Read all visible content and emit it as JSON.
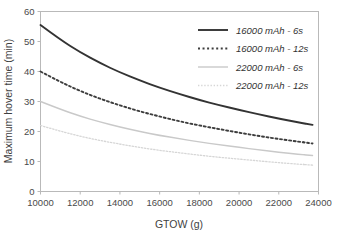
{
  "chart_data": {
    "type": "line",
    "title": "",
    "xlabel": "GTOW (g)",
    "ylabel": "Maximum hover time (min)",
    "xlim": [
      10000,
      24000
    ],
    "ylim": [
      0,
      60
    ],
    "xticks": [
      "10000",
      "12000",
      "14000",
      "16000",
      "18000",
      "20000",
      "22000",
      "24000"
    ],
    "yticks": [
      "0",
      "10",
      "20",
      "30",
      "40",
      "50",
      "60"
    ],
    "grid": false,
    "legend_position": "top-right",
    "x": [
      10000,
      11000,
      12000,
      13000,
      14000,
      15000,
      16000,
      17000,
      18000,
      19000,
      20000,
      21000,
      22000,
      23000,
      23700
    ],
    "series": [
      {
        "name": "16000 mAh - 6s",
        "style": "solid",
        "color": "#333333",
        "width": 1.9,
        "values": [
          55.5,
          50.6,
          46.4,
          42.8,
          39.7,
          37.0,
          34.6,
          32.5,
          30.5,
          28.8,
          27.2,
          25.7,
          24.3,
          23.0,
          22.2
        ]
      },
      {
        "name": "16000 mAh - 12s",
        "style": "dotted",
        "color": "#3d3d3d",
        "width": 1.9,
        "values": [
          40.0,
          36.5,
          33.5,
          30.9,
          28.7,
          26.7,
          25.0,
          23.4,
          22.0,
          20.8,
          19.6,
          18.5,
          17.5,
          16.6,
          16.0
        ]
      },
      {
        "name": "22000 mAh - 6s",
        "style": "solid",
        "color": "#c9c9c9",
        "width": 1.4,
        "values": [
          30.0,
          27.4,
          25.1,
          23.2,
          21.5,
          20.0,
          18.7,
          17.6,
          16.5,
          15.6,
          14.7,
          13.9,
          13.1,
          12.4,
          12.0
        ]
      },
      {
        "name": "22000 mAh - 12s",
        "style": "dotted",
        "color": "#d6d6d6",
        "width": 1.3,
        "values": [
          22.0,
          20.1,
          18.4,
          17.0,
          15.8,
          14.7,
          13.7,
          12.9,
          12.1,
          11.4,
          10.8,
          10.2,
          9.6,
          9.1,
          8.8
        ]
      }
    ]
  },
  "legend": {
    "entries": [
      {
        "label": "16000 mAh - 6s"
      },
      {
        "label": "16000 mAh - 12s"
      },
      {
        "label": "22000 mAh - 6s"
      },
      {
        "label": "22000 mAh - 12s"
      }
    ]
  }
}
